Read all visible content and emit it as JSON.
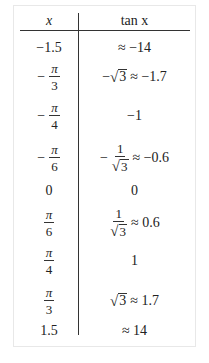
{
  "table": {
    "headers": {
      "x": "x",
      "tan": "tan x"
    },
    "rows": [
      {
        "x": "−1.5",
        "tan": "≈ −14"
      },
      {
        "x_sign": "−",
        "x_num": "π",
        "x_den": "3",
        "tan_sign": "−",
        "tan_root": "3",
        "tan_approx": "≈ −1.7"
      },
      {
        "x_sign": "−",
        "x_num": "π",
        "x_den": "4",
        "tan": "−1"
      },
      {
        "x_sign": "−",
        "x_num": "π",
        "x_den": "6",
        "tan_sign": "−",
        "tan_num": "1",
        "tan_root": "3",
        "tan_approx": "≈ −0.6"
      },
      {
        "x": "0",
        "tan": "0"
      },
      {
        "x_num": "π",
        "x_den": "6",
        "tan_num": "1",
        "tan_root": "3",
        "tan_approx": "≈ 0.6"
      },
      {
        "x_num": "π",
        "x_den": "4",
        "tan": "1"
      },
      {
        "x_num": "π",
        "x_den": "3",
        "tan_root": "3",
        "tan_approx": "≈ 1.7"
      },
      {
        "x": "1.5",
        "tan": "≈ 14"
      }
    ],
    "radical": "√"
  }
}
